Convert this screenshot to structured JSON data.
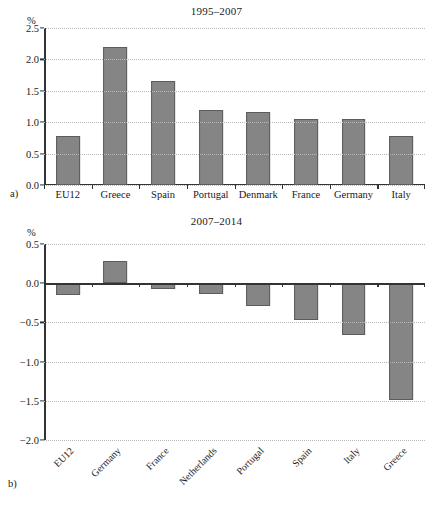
{
  "figure": {
    "panel_a_letter": "a)",
    "panel_b_letter": "b)"
  },
  "chart_data": [
    {
      "type": "bar",
      "panel": "a",
      "title": "1995–2007",
      "xlabel": "",
      "ylabel": "%",
      "unit": "%",
      "ylim": [
        0.0,
        2.5
      ],
      "yticks": [
        0.0,
        0.5,
        1.0,
        1.5,
        2.0,
        2.5
      ],
      "ytick_labels": [
        "0.0",
        "0.5",
        "1.0",
        "1.5",
        "2.0",
        "2.5"
      ],
      "grid": true,
      "legend": "none",
      "categories": [
        "EU12",
        "Greece",
        "Spain",
        "Portugal",
        "Denmark",
        "France",
        "Germany",
        "Italy"
      ],
      "values": [
        0.78,
        2.2,
        1.66,
        1.2,
        1.16,
        1.05,
        1.05,
        0.78
      ],
      "bar_color": "#858585",
      "bar_edge_color": "#5c5c5c",
      "label_rotation": 0
    },
    {
      "type": "bar",
      "panel": "b",
      "title": "2007–2014",
      "xlabel": "",
      "ylabel": "%",
      "unit": "%",
      "ylim": [
        -2.0,
        0.5
      ],
      "yticks": [
        0.5,
        0.0,
        -0.5,
        -1.0,
        -1.5,
        -2.0
      ],
      "ytick_labels": [
        "0.5",
        "0.0",
        "−0.5",
        "−1.0",
        "−1.5",
        "−2.0"
      ],
      "grid": true,
      "legend": "none",
      "categories": [
        "EU12",
        "Germany",
        "France",
        "Netherlands",
        "Portugal",
        "Spain",
        "Italy",
        "Greece"
      ],
      "values": [
        -0.15,
        0.28,
        -0.07,
        -0.14,
        -0.29,
        -0.47,
        -0.66,
        -1.49
      ],
      "bar_color": "#858585",
      "bar_edge_color": "#5c5c5c",
      "label_rotation": -45
    }
  ]
}
